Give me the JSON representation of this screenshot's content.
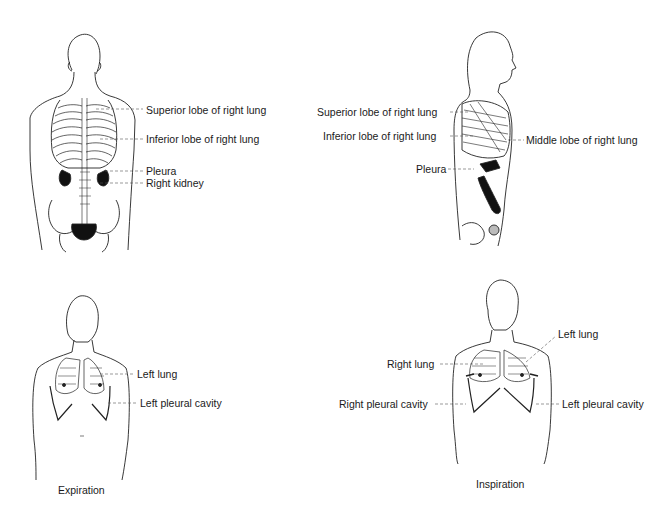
{
  "panels": [
    {
      "id": "back-view",
      "labels": [
        {
          "text": "Superior lobe of right lung",
          "x": 146,
          "y": 104
        },
        {
          "text": "Inferior lobe of right lung",
          "x": 146,
          "y": 133
        },
        {
          "text": "Pleura",
          "x": 146,
          "y": 165
        },
        {
          "text": "Right kidney",
          "x": 146,
          "y": 177
        }
      ]
    },
    {
      "id": "side-view",
      "labels": [
        {
          "text": "Superior lobe of right lung",
          "x": 317,
          "y": 106
        },
        {
          "text": "Inferior lobe of right lung",
          "x": 323,
          "y": 130
        },
        {
          "text": "Middle lobe of right lung",
          "x": 526,
          "y": 134
        },
        {
          "text": "Pleura",
          "x": 416,
          "y": 163
        }
      ]
    },
    {
      "id": "expiration-view",
      "caption": "Expiration",
      "labels": [
        {
          "text": "Left lung",
          "x": 137,
          "y": 368
        },
        {
          "text": "Left pleural cavity",
          "x": 140,
          "y": 401
        }
      ]
    },
    {
      "id": "inspiration-view",
      "caption": "Inspiration",
      "labels": [
        {
          "text": "Left lung",
          "x": 558,
          "y": 328
        },
        {
          "text": "Right lung",
          "x": 387,
          "y": 358
        },
        {
          "text": "Right pleural cavity",
          "x": 339,
          "y": 398
        },
        {
          "text": "Left pleural cavity",
          "x": 562,
          "y": 398
        }
      ]
    }
  ],
  "captions": {
    "expiration": "Expiration",
    "inspiration": "Inspiration"
  }
}
